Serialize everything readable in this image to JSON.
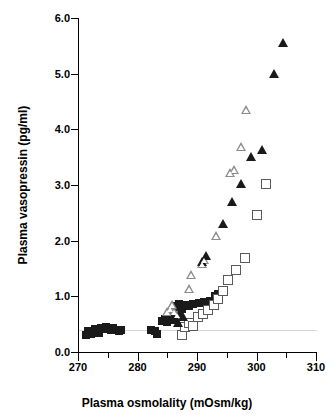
{
  "chart_data": {
    "type": "scatter",
    "title": "",
    "xlabel": "Plasma osmolality (mOsm/kg)",
    "ylabel": "Plasma vasopressin (pg/ml)",
    "xlim": [
      270,
      310
    ],
    "ylim": [
      0.0,
      6.0
    ],
    "xticks": [
      270,
      280,
      290,
      300,
      310
    ],
    "xtick_labels": [
      "270",
      "280",
      "290",
      "300",
      "310"
    ],
    "xminor_ticks": [
      275,
      285,
      295,
      305
    ],
    "yticks": [
      0.0,
      1.0,
      2.0,
      3.0,
      4.0,
      5.0,
      6.0
    ],
    "ytick_labels": [
      "0.0",
      "1.0",
      "2.0",
      "3.0",
      "4.0",
      "5.0",
      "6.0"
    ],
    "grid": false,
    "legend": "none",
    "reference_line_y": 0.4,
    "colors": {
      "filled": "#1a1a1a",
      "open_outline": "#5a5a5a",
      "open_triangle_outline": "#8c8c8c",
      "reference_line": "#d8d8d8",
      "axis": "#000000",
      "background": "#ffffff"
    },
    "series": [
      {
        "name": "filled-square",
        "marker": "filled-square",
        "points": [
          [
            271.3,
            0.3
          ],
          [
            271.6,
            0.37
          ],
          [
            272.2,
            0.33
          ],
          [
            272.8,
            0.42
          ],
          [
            273.2,
            0.4
          ],
          [
            273.5,
            0.34
          ],
          [
            273.9,
            0.44
          ],
          [
            274.3,
            0.41
          ],
          [
            274.7,
            0.45
          ],
          [
            275.1,
            0.43
          ],
          [
            275.5,
            0.39
          ],
          [
            275.9,
            0.44
          ],
          [
            276.4,
            0.4
          ],
          [
            276.9,
            0.38
          ],
          [
            277.3,
            0.39
          ],
          [
            282.2,
            0.4
          ],
          [
            283.0,
            0.37
          ],
          [
            283.2,
            0.33
          ],
          [
            284.2,
            0.56
          ],
          [
            284.6,
            0.6
          ],
          [
            285.0,
            0.54
          ],
          [
            285.6,
            0.58
          ],
          [
            286.0,
            0.62
          ],
          [
            286.3,
            0.7
          ],
          [
            286.6,
            0.82
          ],
          [
            287.0,
            0.86
          ],
          [
            287.4,
            0.78
          ],
          [
            288.0,
            0.85
          ],
          [
            288.6,
            0.83
          ],
          [
            289.4,
            0.86
          ],
          [
            290.3,
            0.88
          ],
          [
            291.2,
            0.9
          ],
          [
            292.2,
            0.92
          ],
          [
            293.0,
            1.0
          ],
          [
            293.6,
            1.05
          ]
        ]
      },
      {
        "name": "open-square",
        "marker": "open-square",
        "points": [
          [
            287.4,
            0.3
          ],
          [
            288.0,
            0.45
          ],
          [
            288.6,
            0.52
          ],
          [
            289.4,
            0.47
          ],
          [
            290.2,
            0.62
          ],
          [
            291.0,
            0.68
          ],
          [
            291.9,
            0.76
          ],
          [
            292.8,
            0.84
          ],
          [
            293.6,
            0.96
          ],
          [
            294.4,
            1.1
          ],
          [
            295.2,
            1.3
          ],
          [
            296.6,
            1.48
          ],
          [
            298.0,
            1.69
          ],
          [
            300.0,
            2.47
          ],
          [
            301.6,
            3.01
          ]
        ]
      },
      {
        "name": "open-triangle",
        "marker": "open-triangle",
        "points": [
          [
            285.0,
            0.72
          ],
          [
            285.4,
            0.78
          ],
          [
            285.8,
            0.84
          ],
          [
            286.2,
            0.72
          ],
          [
            286.6,
            0.66
          ],
          [
            288.6,
            1.14
          ],
          [
            289.0,
            1.38
          ],
          [
            290.8,
            1.58
          ],
          [
            291.2,
            1.66
          ],
          [
            293.2,
            2.08
          ],
          [
            295.6,
            3.22
          ],
          [
            296.2,
            3.27
          ],
          [
            297.4,
            3.68
          ],
          [
            298.2,
            4.35
          ]
        ]
      },
      {
        "name": "filled-triangle",
        "marker": "filled-triangle",
        "points": [
          [
            286.0,
            0.63
          ],
          [
            286.4,
            0.58
          ],
          [
            286.8,
            0.52
          ],
          [
            287.2,
            0.7
          ],
          [
            287.6,
            0.62
          ],
          [
            290.9,
            1.62
          ],
          [
            291.5,
            1.72
          ],
          [
            294.4,
            2.3
          ],
          [
            295.8,
            2.7
          ],
          [
            297.4,
            3.02
          ],
          [
            299.0,
            3.5
          ],
          [
            300.9,
            3.63
          ],
          [
            303.0,
            4.99
          ],
          [
            304.5,
            5.55
          ]
        ]
      }
    ]
  }
}
